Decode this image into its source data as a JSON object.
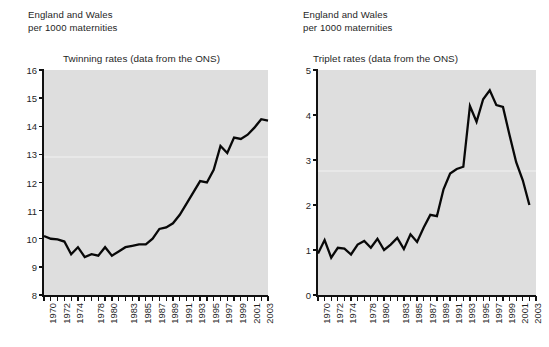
{
  "figure": {
    "caption_line1": "England and Wales",
    "caption_line2": "per 1000 maternities",
    "background_color": "#ffffff",
    "plot_background_color": "#dedede",
    "line_color": "#080808"
  },
  "panels": [
    {
      "id": "twinning",
      "caption_line1": "England and Wales",
      "caption_line2": "per 1000 maternities",
      "title": "Twinning rates (data from the ONS)"
    },
    {
      "id": "triplet",
      "caption_line1": "England and Wales",
      "caption_line2": "per 1000 maternities",
      "title": "Triplet rates (data from the ONS)"
    }
  ],
  "chart_data": [
    {
      "type": "line",
      "title": "Twinning rates (data from the ONS)",
      "subtitle": "England and Wales per 1000 maternities",
      "xlabel": "",
      "ylabel": "",
      "ylim": [
        8,
        16
      ],
      "yticks": [
        8,
        9,
        10,
        11,
        12,
        13,
        14,
        15,
        16
      ],
      "ytick_labels": [
        "8",
        "9",
        "10",
        "11",
        "12",
        "13",
        "14",
        "15",
        "16"
      ],
      "grid": false,
      "legend": "none",
      "x": [
        1970,
        1971,
        1972,
        1973,
        1974,
        1975,
        1976,
        1977,
        1978,
        1979,
        1980,
        1981,
        1982,
        1983,
        1984,
        1985,
        1986,
        1987,
        1988,
        1989,
        1990,
        1991,
        1992,
        1993,
        1994,
        1995,
        1996,
        1997,
        1998,
        1999,
        2000,
        2001,
        2002,
        2003
      ],
      "xtick_labels": [
        "1970",
        "",
        "1972",
        "",
        "1974",
        "",
        "",
        "1978",
        "",
        "1980",
        "",
        "",
        "1983",
        "",
        "1985",
        "",
        "1987",
        "",
        "1989",
        "",
        "1991",
        "",
        "1993",
        "",
        "1995",
        "",
        "1997",
        "",
        "1999",
        "",
        "2001",
        "",
        "2003"
      ],
      "xtick_labels_shown": [
        "1970",
        "1972",
        "1974",
        "1978",
        "1980",
        "1983",
        "1985",
        "1987",
        "1989",
        "1991",
        "1993",
        "1995",
        "1997",
        "1999",
        "2001",
        "2003"
      ],
      "values": [
        10.1,
        10.0,
        9.98,
        9.9,
        9.45,
        9.7,
        9.35,
        9.45,
        9.4,
        9.7,
        9.4,
        9.55,
        9.7,
        9.75,
        9.8,
        9.8,
        10.0,
        10.35,
        10.4,
        10.55,
        10.85,
        11.25,
        11.65,
        12.05,
        12.0,
        12.45,
        13.3,
        13.05,
        13.6,
        13.55,
        13.7,
        13.95,
        14.25,
        14.2
      ]
    },
    {
      "type": "line",
      "title": "Triplet rates (data from the ONS)",
      "subtitle": "England and Wales per 1000 maternities",
      "xlabel": "",
      "ylabel": "",
      "ylim": [
        0,
        5
      ],
      "yticks": [
        0,
        1,
        2,
        3,
        4,
        5
      ],
      "ytick_labels": [
        "0",
        "1",
        "2",
        "3",
        "4",
        "5"
      ],
      "grid": false,
      "legend": "none",
      "x": [
        1970,
        1971,
        1972,
        1973,
        1974,
        1975,
        1976,
        1977,
        1978,
        1979,
        1980,
        1981,
        1982,
        1983,
        1984,
        1985,
        1986,
        1987,
        1988,
        1989,
        1990,
        1991,
        1992,
        1993,
        1994,
        1995,
        1996,
        1997,
        1998,
        1999,
        2000,
        2001,
        2002,
        2003
      ],
      "xtick_labels": [
        "1970",
        "",
        "1972",
        "",
        "1974",
        "",
        "",
        "1978",
        "",
        "1980",
        "",
        "",
        "1983",
        "",
        "1985",
        "",
        "1987",
        "",
        "1989",
        "",
        "1991",
        "",
        "1993",
        "",
        "1995",
        "",
        "1997",
        "",
        "1999",
        "",
        "2001",
        "",
        "2003"
      ],
      "xtick_labels_shown": [
        "1970",
        "1972",
        "1974",
        "1978",
        "1980",
        "1983",
        "1985",
        "1987",
        "1989",
        "1991",
        "1993",
        "1995",
        "1997",
        "1999",
        "2001",
        "2003"
      ],
      "values": [
        0.92,
        1.22,
        0.83,
        1.05,
        1.03,
        0.9,
        1.12,
        1.2,
        1.05,
        1.25,
        1.0,
        1.12,
        1.27,
        1.02,
        1.35,
        1.18,
        1.5,
        1.78,
        1.75,
        2.35,
        2.7,
        2.8,
        2.85,
        4.2,
        3.85,
        4.35,
        4.55,
        4.22,
        4.18,
        3.55,
        2.95,
        2.55,
        2.0
      ]
    }
  ]
}
